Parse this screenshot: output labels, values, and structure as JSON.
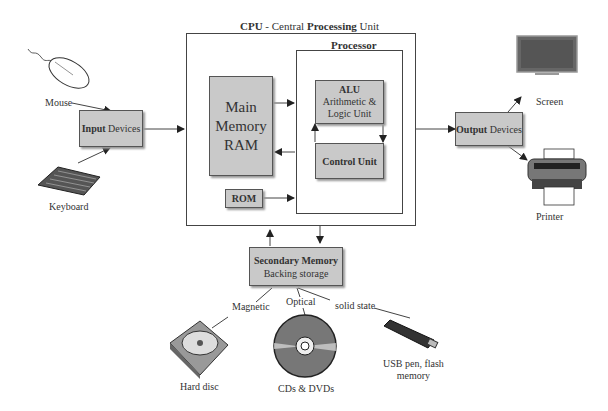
{
  "cpu": {
    "title_prefix": "CPU",
    "title_mid": " - Central ",
    "title_bold": "Processing",
    "title_suffix": " Unit"
  },
  "processor": {
    "title": "Processor"
  },
  "main_memory": {
    "line1": "Main",
    "line2": "Memory",
    "line3": "RAM"
  },
  "rom": {
    "label": "ROM"
  },
  "alu": {
    "title": "ALU",
    "line2": "Arithmetic &",
    "line3": "Logic Unit"
  },
  "control_unit": {
    "label": "Control Unit"
  },
  "input": {
    "bold": "Input",
    "rest": " Devices",
    "mouse": "Mouse",
    "keyboard": "Keyboard"
  },
  "output": {
    "bold": "Output",
    "rest": " Devices",
    "screen": "Screen",
    "printer": "Printer"
  },
  "secondary": {
    "title": "Secondary Memory",
    "subtitle": "Backing storage",
    "magnetic": "Magnetic",
    "optical": "Optical",
    "solid_state": "solid state",
    "hard_disc": "Hard disc",
    "cds": "CDs & DVDs",
    "usb_line1": "USB pen, flash",
    "usb_line2": "memory"
  }
}
